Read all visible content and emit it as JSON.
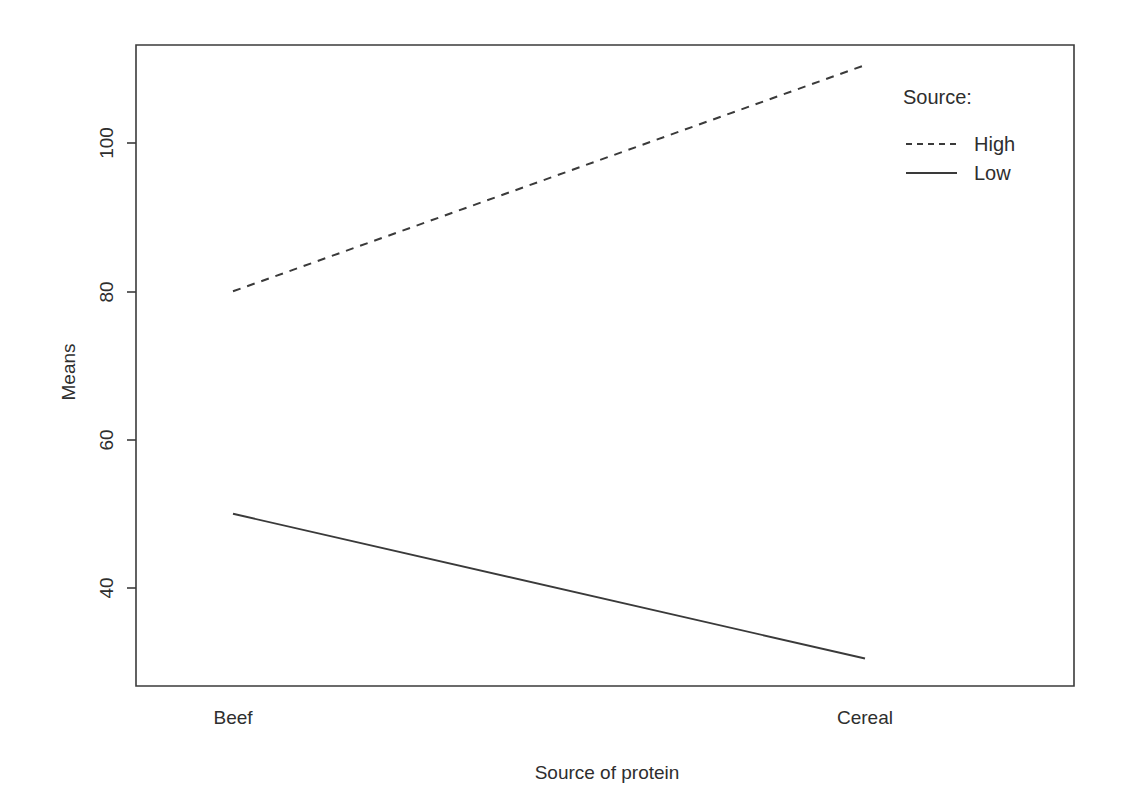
{
  "chart_data": {
    "type": "line",
    "title": "",
    "subtitle": "",
    "xlabel": "Source of protein",
    "ylabel": "Means",
    "categories": [
      "Beef",
      "Cereal"
    ],
    "series": [
      {
        "name": "High",
        "values": [
          80,
          110.5
        ],
        "style": "dashed"
      },
      {
        "name": "Low",
        "values": [
          50,
          30.5
        ],
        "style": "solid"
      }
    ],
    "yticks": [
      40,
      60,
      80,
      100
    ],
    "ytick_labels": [
      "40",
      "60",
      "80",
      "100"
    ],
    "ylim": [
      27,
      114
    ],
    "xlim": [
      0,
      1
    ],
    "grid": false,
    "legend": {
      "title": "Source:",
      "position": "top-right-outside",
      "entries": [
        {
          "label": "High",
          "style": "dashed"
        },
        {
          "label": "Low",
          "style": "solid"
        }
      ]
    },
    "colors": {
      "line": "#3a3a3a",
      "axis": "#3b3b3b",
      "text": "#2e2e2e",
      "background": "#ffffff"
    }
  },
  "axes": {
    "y_title": "Means",
    "x_title": "Source of protein",
    "y_tick_labels": [
      "100",
      "80",
      "60",
      "40"
    ],
    "x_tick_labels": [
      "Beef",
      "Cereal"
    ]
  },
  "legend": {
    "title": "Source:",
    "item_high": "High",
    "item_low": "Low"
  }
}
